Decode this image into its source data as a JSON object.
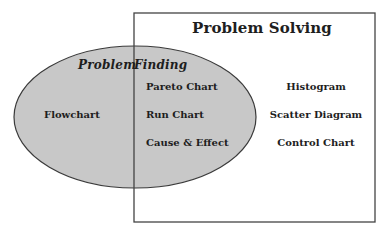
{
  "colors": {
    "ellipse_fill": "#c8c8c8",
    "ellipse_stroke": "#3a3a3a",
    "rect_stroke": "#444444",
    "text": "#1e1e1e",
    "background": "#ffffff"
  },
  "rectangle": {
    "title": "Problem Solving",
    "items": [
      "Histogram",
      "Scatter Diagram",
      "Control Chart"
    ]
  },
  "ellipse": {
    "title_left": "Problem",
    "title_right": "Finding",
    "items": [
      "Flowchart"
    ]
  },
  "overlap": {
    "items": [
      "Pareto Chart",
      "Run Chart",
      "Cause & Effect"
    ]
  }
}
